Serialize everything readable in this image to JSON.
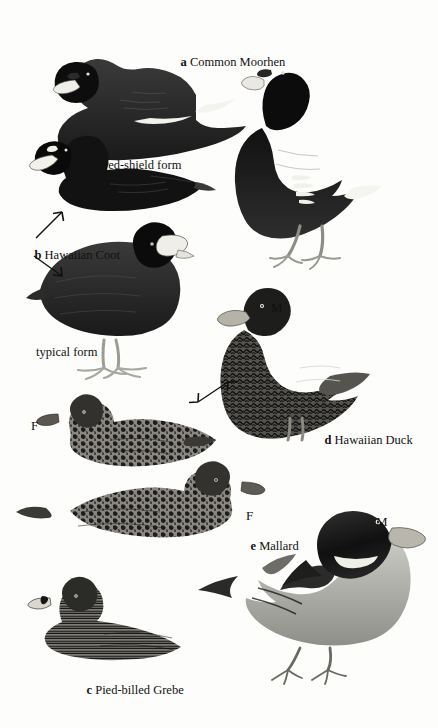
{
  "plate": {
    "background_color": "#fdfdfb",
    "ink_color": "#111111",
    "width": 438,
    "height": 728,
    "style": "black-and-white scratchboard field-guide illustration"
  },
  "captions": [
    {
      "letter": "a",
      "name": "Common Moorhen"
    },
    {
      "letter": "b",
      "name": "Hawaiian Coot"
    },
    {
      "letter": "c",
      "name": "Pied-billed Grebe"
    },
    {
      "letter": "d",
      "name": "Hawaiian Duck"
    },
    {
      "letter": "e",
      "name": "Mallard"
    }
  ],
  "form_labels": [
    {
      "text": "red-shield form"
    },
    {
      "text": "typical  form"
    }
  ],
  "sex_markers": [
    {
      "text": "M",
      "applies_to": "Hawaiian Duck male"
    },
    {
      "text": "F",
      "applies_to": "Hawaiian Duck female"
    },
    {
      "text": "F",
      "applies_to": "Mallard female"
    },
    {
      "text": "M",
      "applies_to": "Mallard male"
    }
  ],
  "figures": [
    {
      "id": "moorhen-swimming",
      "species": "Common Moorhen",
      "pose": "swimming, facing left"
    },
    {
      "id": "moorhen-standing",
      "species": "Common Moorhen",
      "pose": "standing, facing left"
    },
    {
      "id": "coot-red-shield",
      "species": "Hawaiian Coot",
      "form": "red-shield form",
      "pose": "swimming, facing left"
    },
    {
      "id": "coot-typical",
      "species": "Hawaiian Coot",
      "form": "typical form",
      "pose": "standing, facing right"
    },
    {
      "id": "hawaiian-duck-male",
      "species": "Hawaiian Duck",
      "sex": "M",
      "pose": "standing, facing left"
    },
    {
      "id": "hawaiian-duck-female",
      "species": "Hawaiian Duck",
      "sex": "F",
      "pose": "swimming, facing left"
    },
    {
      "id": "mallard-female",
      "species": "Mallard",
      "sex": "F",
      "pose": "swimming, facing right"
    },
    {
      "id": "mallard-male",
      "species": "Mallard",
      "sex": "M",
      "pose": "standing, facing right"
    },
    {
      "id": "pied-billed-grebe",
      "species": "Pied-billed Grebe",
      "pose": "swimming, facing left"
    }
  ],
  "arrows": [
    {
      "from": "b Hawaiian Coot label",
      "to": "coot-red-shield",
      "type": "single"
    },
    {
      "from": "b Hawaiian Coot label",
      "to": "coot-typical",
      "type": "single"
    },
    {
      "from": "hawaiian-duck-female",
      "to": "hawaiian-duck-male",
      "type": "double"
    }
  ]
}
